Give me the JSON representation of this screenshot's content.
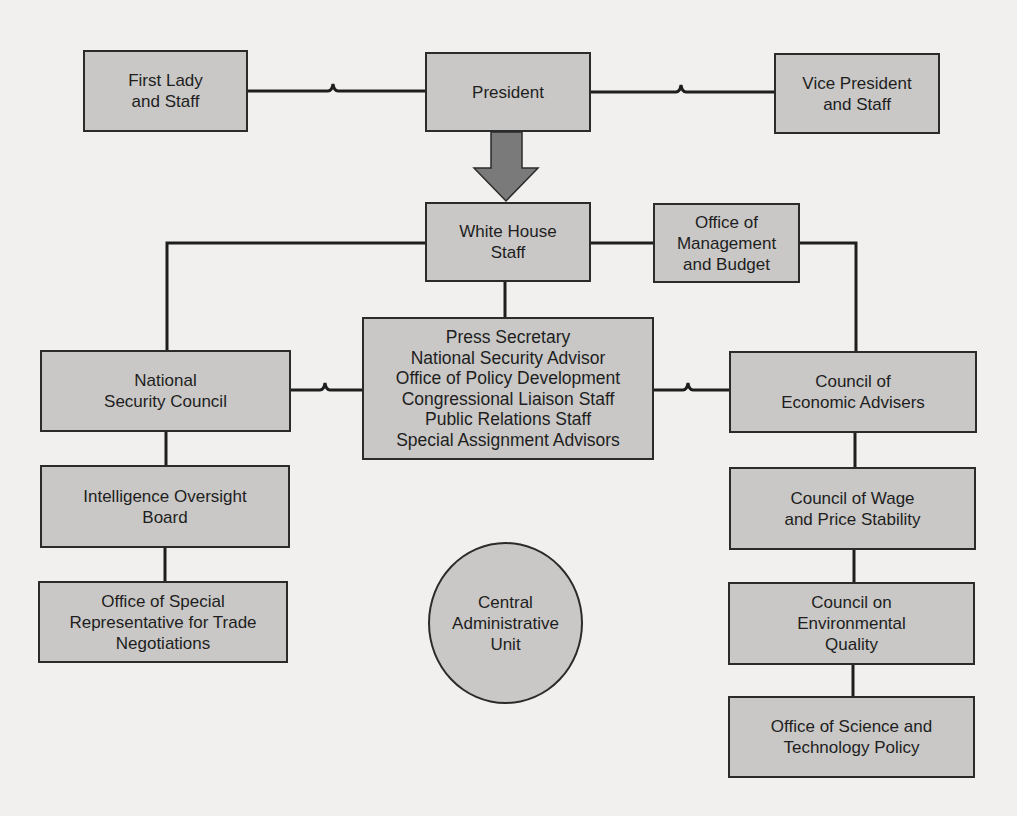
{
  "diagram": {
    "type": "org-chart",
    "nodes": {
      "first_lady": "First Lady\nand Staff",
      "president": "President",
      "vice_president": "Vice President\nand Staff",
      "white_house_staff": "White House\nStaff",
      "omb": "Office of\nManagement\nand Budget",
      "nsc": "National\nSecurity Council",
      "advisors": "Press Secretary\nNational Security Advisor\nOffice of Policy Development\nCongressional Liaison Staff\nPublic Relations Staff\nSpecial Assignment Advisors",
      "cea": "Council of\nEconomic Advisers",
      "iob": "Intelligence Oversight\nBoard",
      "trade": "Office of Special\nRepresentative for Trade\nNegotiations",
      "cau": "Central\nAdministrative\nUnit",
      "wage_price": "Council of Wage\nand Price Stability",
      "environment": "Council on\nEnvironmental\nQuality",
      "science": "Office of Science and\nTechnology Policy"
    },
    "edges": [
      {
        "from": "first_lady",
        "to": "president",
        "style": "bridge"
      },
      {
        "from": "president",
        "to": "vice_president",
        "style": "bridge"
      },
      {
        "from": "president",
        "to": "white_house_staff",
        "style": "arrow"
      },
      {
        "from": "white_house_staff",
        "to": "omb",
        "style": "line"
      },
      {
        "from": "white_house_staff",
        "to": "nsc",
        "style": "line"
      },
      {
        "from": "white_house_staff",
        "to": "advisors",
        "style": "line"
      },
      {
        "from": "omb",
        "to": "cea",
        "style": "line"
      },
      {
        "from": "nsc",
        "to": "advisors",
        "style": "bridge"
      },
      {
        "from": "advisors",
        "to": "cea",
        "style": "bridge"
      },
      {
        "from": "nsc",
        "to": "iob",
        "style": "line"
      },
      {
        "from": "iob",
        "to": "trade",
        "style": "line"
      },
      {
        "from": "cea",
        "to": "wage_price",
        "style": "line"
      },
      {
        "from": "wage_price",
        "to": "environment",
        "style": "line"
      },
      {
        "from": "environment",
        "to": "science",
        "style": "line"
      }
    ],
    "colors": {
      "box_fill": "#c9c8c6",
      "border": "#2b2b2b",
      "arrow_fill": "#7a7a7a",
      "background": "#f1f0ee"
    }
  }
}
